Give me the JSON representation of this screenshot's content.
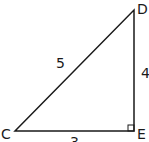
{
  "diagram": {
    "type": "right-triangle",
    "vertices": {
      "C": {
        "label": "C",
        "x": 15,
        "y": 131
      },
      "D": {
        "label": "D",
        "x": 134,
        "y": 10
      },
      "E": {
        "label": "E",
        "x": 134,
        "y": 131
      }
    },
    "sides": {
      "CD": {
        "label": "5"
      },
      "DE": {
        "label": "4"
      },
      "CE": {
        "label": "3"
      }
    },
    "right_angle_at": "E",
    "stroke_color": "#1a1a1a"
  }
}
